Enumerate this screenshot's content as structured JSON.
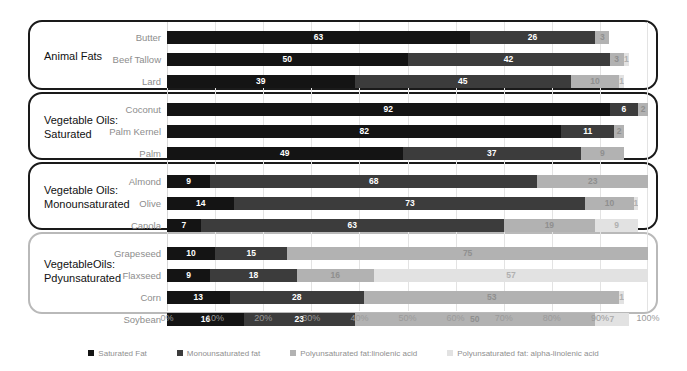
{
  "chart_data": {
    "type": "bar",
    "subtype": "stacked-horizontal-100pct",
    "title": "",
    "xlabel": "",
    "ylabel": "",
    "xlim": [
      0,
      100
    ],
    "grid": true,
    "legend_position": "bottom",
    "tick_labels": [
      "0%",
      "10%",
      "20%",
      "30%",
      "40%",
      "50%",
      "60%",
      "70%",
      "80%",
      "90%",
      "100%"
    ],
    "tick_values": [
      0,
      10,
      20,
      30,
      40,
      50,
      60,
      70,
      80,
      90,
      100
    ],
    "series": [
      {
        "name": "Saturated Fat",
        "color": "#141414"
      },
      {
        "name": "Monounsaturated fat",
        "color": "#3c3c3c"
      },
      {
        "name": "Polyunsaturated fat:linolenic acid",
        "color": "#b2b2b2"
      },
      {
        "name": "Polyunsaturated fat: alpha-linolenic acid",
        "color": "#e2e2e2"
      }
    ],
    "categories": [
      "Butter",
      "Beef Tallow",
      "Lard",
      "Coconut",
      "Palm Kernel",
      "Palm",
      "Almond",
      "Olive",
      "Canola",
      "Grapeseed",
      "Flaxseed",
      "Corn",
      "Soybean"
    ],
    "values": [
      [
        63,
        26,
        3,
        0
      ],
      [
        50,
        42,
        3,
        1
      ],
      [
        39,
        45,
        10,
        1
      ],
      [
        92,
        6,
        2,
        0
      ],
      [
        82,
        11,
        2,
        0
      ],
      [
        49,
        37,
        9,
        0
      ],
      [
        9,
        68,
        23,
        0
      ],
      [
        14,
        73,
        10,
        1
      ],
      [
        7,
        63,
        19,
        9
      ],
      [
        10,
        15,
        75,
        0
      ],
      [
        9,
        18,
        16,
        57
      ],
      [
        13,
        28,
        53,
        1
      ],
      [
        16,
        23,
        50,
        7
      ]
    ],
    "groups": [
      {
        "label": "Animal Fats",
        "categories": [
          "Butter",
          "Beef Tallow",
          "Lard"
        ],
        "border": "#1a1a1a"
      },
      {
        "label": "Vegetable Oils:\nSaturated",
        "categories": [
          "Coconut",
          "Palm Kernel",
          "Palm"
        ],
        "border": "#1a1a1a"
      },
      {
        "label": "Vegetable Oils:\nMonounsaturated",
        "categories": [
          "Almond",
          "Olive",
          "Canola"
        ],
        "border": "#1a1a1a"
      },
      {
        "label": "VegetableOils:\nPdyunsaturated",
        "categories": [
          "Grapeseed",
          "Flaxseed",
          "Corn",
          "Soybean"
        ],
        "border": "#b9b9b9"
      }
    ]
  },
  "legend": {
    "items": [
      {
        "label": "Saturated Fat",
        "color": "#141414"
      },
      {
        "label": "Monounsaturated fat",
        "color": "#3c3c3c"
      },
      {
        "label": "Polyunsaturated fat:linolenic acid",
        "color": "#b2b2b2"
      },
      {
        "label": "Polyunsaturated fat: alpha-linolenic acid",
        "color": "#e2e2e2"
      }
    ]
  }
}
